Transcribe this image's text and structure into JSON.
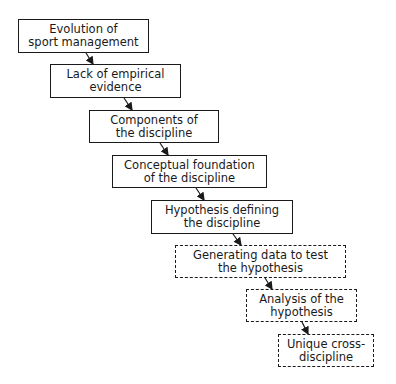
{
  "diagram": {
    "type": "flowchart",
    "direction": "top-left to bottom-right cascade",
    "nodes": [
      {
        "id": "n1",
        "label": "Evolution of\nsport management",
        "style": "solid",
        "x": 18,
        "y": 19,
        "w": 131,
        "h": 34
      },
      {
        "id": "n2",
        "label": "Lack of empirical\nevidence",
        "style": "solid",
        "x": 50,
        "y": 64,
        "w": 131,
        "h": 34
      },
      {
        "id": "n3",
        "label": "Components of\nthe discipline",
        "style": "solid",
        "x": 89,
        "y": 110,
        "w": 130,
        "h": 33
      },
      {
        "id": "n4",
        "label": "Conceptual foundation\nof the discipline",
        "style": "solid",
        "x": 112,
        "y": 155,
        "w": 155,
        "h": 33
      },
      {
        "id": "n5",
        "label": "Hypothesis defining\nthe discipline",
        "style": "solid",
        "x": 151,
        "y": 200,
        "w": 142,
        "h": 34
      },
      {
        "id": "n6",
        "label": "Generating data to test\nthe hypothesis",
        "style": "dashed",
        "x": 175,
        "y": 245,
        "w": 171,
        "h": 33
      },
      {
        "id": "n7",
        "label": "Analysis of the\nhypothesis",
        "style": "dashed",
        "x": 246,
        "y": 289,
        "w": 111,
        "h": 33
      },
      {
        "id": "n8",
        "label": "Unique cross-\ndiscipline",
        "style": "dashed",
        "x": 278,
        "y": 334,
        "w": 96,
        "h": 33
      }
    ],
    "edges": [
      {
        "from": "n1",
        "to": "n2"
      },
      {
        "from": "n2",
        "to": "n3"
      },
      {
        "from": "n3",
        "to": "n4"
      },
      {
        "from": "n4",
        "to": "n5"
      },
      {
        "from": "n5",
        "to": "n6"
      },
      {
        "from": "n6",
        "to": "n7"
      },
      {
        "from": "n7",
        "to": "n8"
      }
    ],
    "colors": {
      "stroke": "#1a1a1a",
      "background": "#ffffff"
    }
  }
}
